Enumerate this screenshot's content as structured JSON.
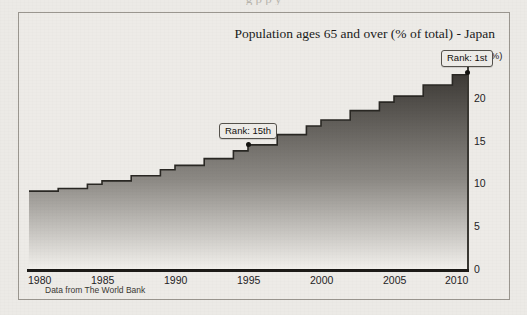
{
  "page": {
    "top_bleed_text": "g                                                p      p    y"
  },
  "figure": {
    "title": "Population ages 65 and over (% of total) - Japan",
    "source_note": "Data from The World Bank",
    "y_unit_label": "(%)",
    "frame_color": "#9a968f",
    "background_color": "#edebe7"
  },
  "annotations": [
    {
      "id": "rank-15th",
      "label": "Rank: 15th",
      "year": 1995,
      "value": 14.5
    },
    {
      "id": "rank-1st",
      "label": "Rank: 1st",
      "year": 2010,
      "value": 23.0
    }
  ],
  "chart_data": {
    "type": "area",
    "title": "Population ages 65 and over (% of total) - Japan",
    "subtitle": "",
    "xlabel": "",
    "ylabel": "(%)",
    "xlim": [
      1980,
      2010
    ],
    "ylim": [
      0,
      25
    ],
    "xticks": [
      1980,
      1985,
      1990,
      1995,
      2000,
      2005,
      2010
    ],
    "yticks": [
      0,
      5,
      10,
      15,
      20,
      25
    ],
    "grid": false,
    "legend": false,
    "series_name": "Population ages 65 and over (% of total)",
    "line_color": "#2a2824",
    "fill_gradient": [
      "#3b3834",
      "#f2f0ec"
    ],
    "x": [
      1980,
      1981,
      1982,
      1983,
      1984,
      1985,
      1986,
      1987,
      1988,
      1989,
      1990,
      1991,
      1992,
      1993,
      1994,
      1995,
      1996,
      1997,
      1998,
      1999,
      2000,
      2001,
      2002,
      2003,
      2004,
      2005,
      2006,
      2007,
      2008,
      2009,
      2010
    ],
    "values": [
      9.1,
      9.1,
      9.4,
      9.4,
      9.9,
      10.3,
      10.3,
      10.9,
      10.9,
      11.6,
      12.1,
      12.1,
      12.9,
      12.9,
      13.8,
      14.5,
      14.5,
      15.7,
      15.7,
      16.7,
      17.4,
      17.4,
      18.5,
      18.5,
      19.5,
      20.2,
      20.2,
      21.5,
      21.5,
      22.7,
      23.0
    ],
    "data_labels": [
      {
        "year": 1995,
        "value": 14.5,
        "label": "Rank: 15th"
      },
      {
        "year": 2010,
        "value": 23.0,
        "label": "Rank: 1st"
      }
    ]
  }
}
